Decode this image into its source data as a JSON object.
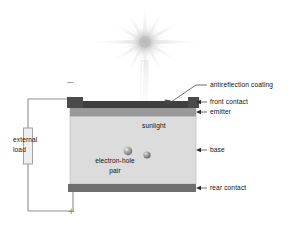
{
  "diagram": {
    "colors": {
      "front_contact": "#3f3f3f",
      "contact_pad": "#4b4b4b",
      "emitter": "#9a9a9a",
      "base": "#dcdcdc",
      "rear_contact": "#6e6e6e",
      "wire": "#8f8f8f",
      "load_fill": "#efefef",
      "sun": "#c9c9c9",
      "text": "#111111",
      "sign": "#8d8d8d"
    },
    "labels": {
      "antireflection_coating": "antireflection coating",
      "front_contact": "front contact",
      "emitter": "emitter",
      "base": "base",
      "rear_contact": "rear contact",
      "sunlight": "sunlight",
      "electron_hole_line1": "electron-hole",
      "electron_hole_line2": "pair",
      "external_load_line1": "external",
      "external_load_line2": "load",
      "terminal_negative": "–",
      "terminal_positive": "+"
    },
    "icons": {
      "sun": "sun-burst-icon",
      "electron": "electron-particle-icon",
      "hole": "hole-particle-icon",
      "load": "resistor-load-icon",
      "pointer": "arrow-pointer-icon",
      "leader": "leader-line-icon"
    }
  }
}
